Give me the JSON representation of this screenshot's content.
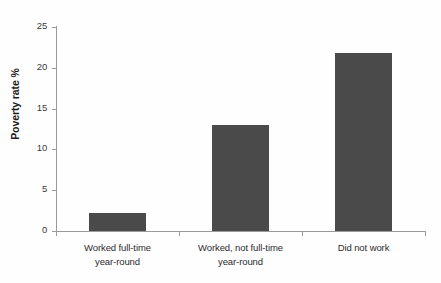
{
  "chart_data": {
    "type": "bar",
    "title": "",
    "xlabel": "",
    "ylabel": "Poverty rate %",
    "categories": [
      "Worked full-time year-round",
      "Worked, not full-time year-round",
      "Did not work"
    ],
    "category_lines": [
      [
        "Worked full-time",
        "year-round"
      ],
      [
        "Worked, not full-time",
        "year-round"
      ],
      [
        "Did not work",
        ""
      ]
    ],
    "values": [
      2.2,
      13.0,
      21.8
    ],
    "ylim": [
      0,
      25
    ],
    "yticks": [
      0,
      5,
      10,
      15,
      20,
      25
    ],
    "ytick_labels": [
      "0",
      "5",
      "10",
      "15",
      "20",
      "25"
    ],
    "grid": false,
    "legend": false,
    "legend_position": "none",
    "bar_color": "#4a4a4a",
    "axis_color": "#9a9a9a",
    "background_color": "#fefefe"
  },
  "axis": {
    "y_title": "Poverty rate %"
  },
  "cut_off_title": ""
}
